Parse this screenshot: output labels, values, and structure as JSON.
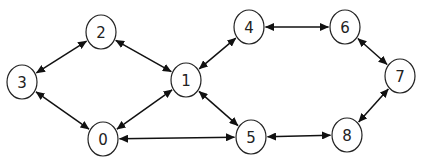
{
  "diagram": {
    "type": "undirected-graph-bidirectional-arrows",
    "style": {
      "node_stroke": "#222222",
      "node_fill": "#ffffff",
      "edge_color": "#111111",
      "label_color": "#222222"
    },
    "nodes": [
      {
        "id": "0",
        "label": "0",
        "x": 103,
        "y": 139,
        "rx": 15,
        "ry": 17
      },
      {
        "id": "1",
        "label": "1",
        "x": 186,
        "y": 80,
        "rx": 15,
        "ry": 17
      },
      {
        "id": "2",
        "label": "2",
        "x": 101,
        "y": 32,
        "rx": 15,
        "ry": 17
      },
      {
        "id": "3",
        "label": "3",
        "x": 22,
        "y": 82,
        "rx": 15,
        "ry": 17
      },
      {
        "id": "4",
        "label": "4",
        "x": 249,
        "y": 27,
        "rx": 15,
        "ry": 17
      },
      {
        "id": "5",
        "label": "5",
        "x": 251,
        "y": 137,
        "rx": 15,
        "ry": 17
      },
      {
        "id": "6",
        "label": "6",
        "x": 345,
        "y": 27,
        "rx": 15,
        "ry": 17
      },
      {
        "id": "7",
        "label": "7",
        "x": 400,
        "y": 76,
        "rx": 15,
        "ry": 17
      },
      {
        "id": "8",
        "label": "8",
        "x": 347,
        "y": 135,
        "rx": 15,
        "ry": 17
      }
    ],
    "edges": [
      {
        "from": "2",
        "to": "3",
        "bidirectional": true
      },
      {
        "from": "2",
        "to": "1",
        "bidirectional": true
      },
      {
        "from": "3",
        "to": "0",
        "bidirectional": true
      },
      {
        "from": "0",
        "to": "1",
        "bidirectional": true
      },
      {
        "from": "0",
        "to": "5",
        "bidirectional": true
      },
      {
        "from": "1",
        "to": "4",
        "bidirectional": true
      },
      {
        "from": "1",
        "to": "5",
        "bidirectional": true
      },
      {
        "from": "4",
        "to": "6",
        "bidirectional": true
      },
      {
        "from": "6",
        "to": "7",
        "bidirectional": true
      },
      {
        "from": "7",
        "to": "8",
        "bidirectional": true
      },
      {
        "from": "5",
        "to": "8",
        "bidirectional": true
      }
    ]
  }
}
